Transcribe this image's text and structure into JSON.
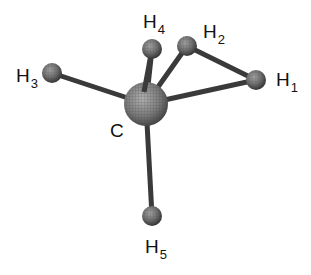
{
  "diagram": {
    "type": "ball-and-stick molecular model",
    "colors": {
      "background": "#ffffff",
      "bond": "#3a3a3a",
      "atom_fill": "#6e6e6e",
      "atom_highlight": "#9a9a9a",
      "atom_shadow": "#2e2e2e",
      "mesh": "#4a4a4a",
      "label": "#111111"
    },
    "atoms": [
      {
        "id": "C",
        "symbol": "C",
        "subscript": "",
        "x": 146,
        "y": 104,
        "r": 22,
        "label_x": 110,
        "label_y": 121
      },
      {
        "id": "H1",
        "symbol": "H",
        "subscript": "1",
        "x": 256,
        "y": 80,
        "r": 10,
        "label_x": 276,
        "label_y": 70
      },
      {
        "id": "H2",
        "symbol": "H",
        "subscript": "2",
        "x": 187,
        "y": 46,
        "r": 10,
        "label_x": 203,
        "label_y": 22
      },
      {
        "id": "H3",
        "symbol": "H",
        "subscript": "3",
        "x": 52,
        "y": 73,
        "r": 10,
        "label_x": 16,
        "label_y": 66
      },
      {
        "id": "H4",
        "symbol": "H",
        "subscript": "4",
        "x": 152,
        "y": 49,
        "r": 10,
        "label_x": 143,
        "label_y": 12
      },
      {
        "id": "H5",
        "symbol": "H",
        "subscript": "5",
        "x": 152,
        "y": 216,
        "r": 10,
        "label_x": 145,
        "label_y": 237
      }
    ],
    "bonds": [
      {
        "from": "C",
        "to": "H1"
      },
      {
        "from": "C",
        "to": "H2"
      },
      {
        "from": "C",
        "to": "H3"
      },
      {
        "from": "C",
        "to": "H4"
      },
      {
        "from": "C",
        "to": "H5"
      },
      {
        "from": "H2",
        "to": "H1"
      }
    ]
  }
}
